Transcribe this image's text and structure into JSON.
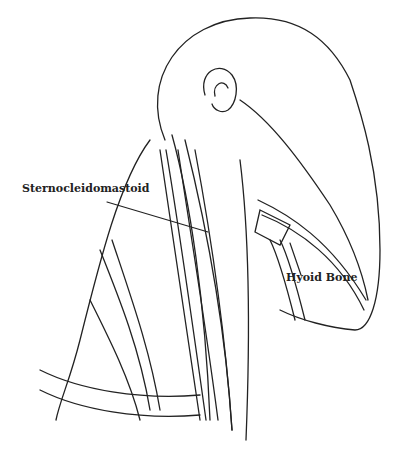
{
  "diagram": {
    "labels": [
      {
        "text": "Sternocleidomastoid",
        "x": 22,
        "y": 188
      },
      {
        "text": "Hyoid Bone",
        "x": 286,
        "y": 277
      }
    ],
    "colors": {
      "ink": "#222222",
      "background": "#ffffff"
    }
  }
}
